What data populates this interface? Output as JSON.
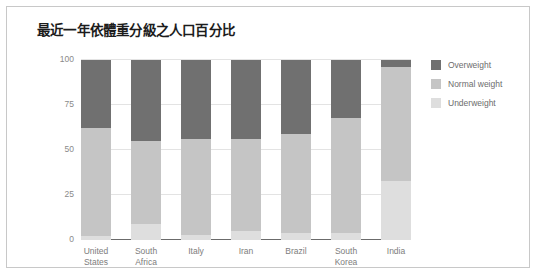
{
  "card": {
    "title": "最近一年依體重分級之人口百分比"
  },
  "legend": {
    "position": "right",
    "items": [
      {
        "label": "Overweight",
        "color": "#707070"
      },
      {
        "label": "Normal weight",
        "color": "#c5c5c5"
      },
      {
        "label": "Underweight",
        "color": "#dedede"
      }
    ]
  },
  "chart_data": {
    "type": "bar",
    "subtype": "stacked-column-100",
    "title": "最近一年依體重分級之人口百分比",
    "xlabel": "",
    "ylabel": "",
    "ylim": [
      0,
      100
    ],
    "yticks": [
      0,
      25,
      50,
      75,
      100
    ],
    "ytick_labels": [
      "0",
      "25",
      "50",
      "75",
      "100"
    ],
    "grid": true,
    "legend_position": "right",
    "categories": [
      "United States",
      "South Africa",
      "Italy",
      "Iran",
      "Brazil",
      "South Korea",
      "India"
    ],
    "category_labels": [
      "United\nStates",
      "South\nAfrica",
      "Italy",
      "Iran",
      "Brazil",
      "South\nKorea",
      "India"
    ],
    "series": [
      {
        "name": "Overweight",
        "color": "#707070",
        "values": [
          38,
          45,
          44,
          44,
          41,
          32,
          4
        ]
      },
      {
        "name": "Normal weight",
        "color": "#c5c5c5",
        "values": [
          60,
          46,
          53,
          51,
          55,
          64,
          63
        ]
      },
      {
        "name": "Underweight",
        "color": "#dedede",
        "values": [
          2,
          9,
          3,
          5,
          4,
          4,
          33
        ]
      }
    ]
  }
}
